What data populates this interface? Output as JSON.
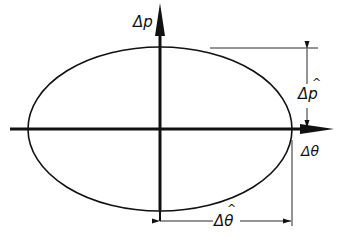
{
  "diagram": {
    "type": "phase-space ellipse",
    "axes": {
      "vertical": {
        "label": "Δp"
      },
      "horizontal": {
        "label": "Δθ"
      }
    },
    "dimensions": {
      "vertical_half_height": {
        "label": "Δp̂",
        "base": "Δp",
        "hat": "^"
      },
      "horizontal_half_width": {
        "label": "Δθ̂",
        "base": "Δθ",
        "hat": "^"
      }
    },
    "colors": {
      "line": "#111111",
      "background": "#ffffff"
    }
  }
}
